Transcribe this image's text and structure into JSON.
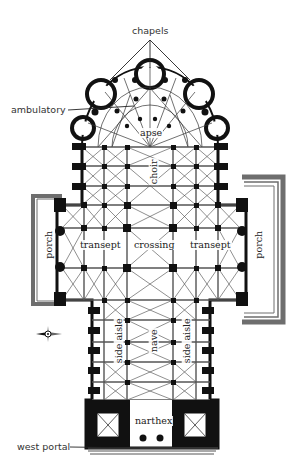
{
  "diagram": {
    "type": "cathedral floor plan",
    "colors": {
      "ink": "#111111",
      "line": "#333333",
      "porch_frame": "#6e6e6e",
      "background": "#ffffff"
    },
    "external_labels": {
      "chapels": "chapels",
      "ambulatory": "ambulatory",
      "west_portal": "west portal"
    },
    "internal_labels": {
      "apse": "apse",
      "choir": "choir",
      "transept_left": "transept",
      "crossing": "crossing",
      "transept_right": "transept",
      "porch_left": "porch",
      "porch_right": "porch",
      "side_aisle_left": "side aisle",
      "nave": "nave",
      "side_aisle_right": "side aisle",
      "narthex": "narthex"
    },
    "compass": {
      "icon": "compass-rose-icon",
      "pointing": "west"
    }
  }
}
